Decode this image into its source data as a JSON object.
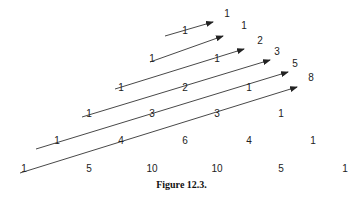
{
  "figure": {
    "caption": "Figure 12.3."
  },
  "triangle": [
    {
      "row": 0,
      "values": [
        {
          "v": "1",
          "x": 227,
          "y": 17
        }
      ]
    },
    {
      "row": 1,
      "values": [
        {
          "v": "1",
          "x": 185,
          "y": 34
        },
        {
          "v": "1",
          "x": 244,
          "y": 29
        }
      ]
    },
    {
      "row": 2,
      "values": [
        {
          "v": "1",
          "x": 152,
          "y": 62
        },
        {
          "v": "1",
          "x": 217,
          "y": 62
        },
        {
          "v": "2",
          "x": 260,
          "y": 44
        }
      ]
    },
    {
      "row": 3,
      "values": [
        {
          "v": "1",
          "x": 121,
          "y": 91
        },
        {
          "v": "2",
          "x": 185,
          "y": 91
        },
        {
          "v": "1",
          "x": 249,
          "y": 91
        },
        {
          "v": "3",
          "x": 277,
          "y": 55
        }
      ]
    },
    {
      "row": 4,
      "values": [
        {
          "v": "1",
          "x": 89,
          "y": 117
        },
        {
          "v": "3",
          "x": 152,
          "y": 117
        },
        {
          "v": "3",
          "x": 217,
          "y": 117
        },
        {
          "v": "1",
          "x": 281,
          "y": 117
        },
        {
          "v": "5",
          "x": 295,
          "y": 67
        }
      ]
    },
    {
      "row": 5,
      "values": [
        {
          "v": "1",
          "x": 57,
          "y": 144
        },
        {
          "v": "4",
          "x": 121,
          "y": 144
        },
        {
          "v": "6",
          "x": 185,
          "y": 144
        },
        {
          "v": "4",
          "x": 249,
          "y": 144
        },
        {
          "v": "1",
          "x": 313,
          "y": 144
        },
        {
          "v": "8",
          "x": 311,
          "y": 81
        }
      ]
    },
    {
      "row": 6,
      "values": [
        {
          "v": "1",
          "x": 24,
          "y": 172
        },
        {
          "v": "5",
          "x": 89,
          "y": 172
        },
        {
          "v": "10",
          "x": 152,
          "y": 172
        },
        {
          "v": "10",
          "x": 217,
          "y": 172
        },
        {
          "v": "5",
          "x": 281,
          "y": 172
        },
        {
          "v": "1",
          "x": 345,
          "y": 172
        }
      ]
    }
  ],
  "arrows": [
    {
      "x1": 165,
      "y1": 36,
      "x2": 213,
      "y2": 22,
      "sum": "1"
    },
    {
      "x1": 150,
      "y1": 62,
      "x2": 223,
      "y2": 36,
      "sum": "1"
    },
    {
      "x1": 115,
      "y1": 89,
      "x2": 244,
      "y2": 49,
      "sum": "2"
    },
    {
      "x1": 82,
      "y1": 117,
      "x2": 270,
      "y2": 60,
      "sum": "3"
    },
    {
      "x1": 36,
      "y1": 149,
      "x2": 288,
      "y2": 72,
      "sum": "5"
    },
    {
      "x1": 20,
      "y1": 173,
      "x2": 297,
      "y2": 87,
      "sum": "8"
    }
  ],
  "colors": {
    "line": "#333333",
    "text": "#222222"
  }
}
